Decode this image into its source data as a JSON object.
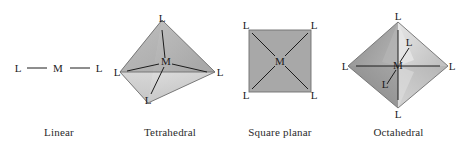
{
  "figure": {
    "background_color": "#ffffff",
    "label_color": "#1c1c1c",
    "caption_color": "#2b2b2b",
    "bond_color": "#1c1c1c",
    "edge_color": "#6f6f6f"
  },
  "geometries": [
    {
      "id": "linear",
      "caption": "Linear",
      "metal_label": "M",
      "ligand_count": 2,
      "ligand_labels": [
        "L",
        "L"
      ],
      "shape_fill": "none"
    },
    {
      "id": "tetrahedral",
      "caption": "Tetrahedral",
      "metal_label": "M",
      "ligand_count": 4,
      "ligand_labels": [
        "L",
        "L",
        "L",
        "L"
      ],
      "face_fills": {
        "left": "#9a9a9a",
        "front": "#c9c9c9",
        "right": "#b4b4b4",
        "bottom": "#d6d6d6"
      }
    },
    {
      "id": "square-planar",
      "caption": "Square planar",
      "metal_label": "M",
      "ligand_count": 4,
      "ligand_labels": [
        "L",
        "L",
        "L",
        "L"
      ],
      "face_fills": {
        "plane": "#a8a8a8"
      }
    },
    {
      "id": "octahedral",
      "caption": "Octahedral",
      "metal_label": "M",
      "ligand_count": 6,
      "ligand_labels": [
        "L",
        "L",
        "L",
        "L",
        "L",
        "L"
      ],
      "face_fills": {
        "upper_left": "#9d9d9d",
        "lower_left": "#8f8f8f",
        "upper_right": "#cfcfcf",
        "lower_right": "#bdbdbd",
        "inner_light": "#e2e2e2"
      }
    }
  ]
}
